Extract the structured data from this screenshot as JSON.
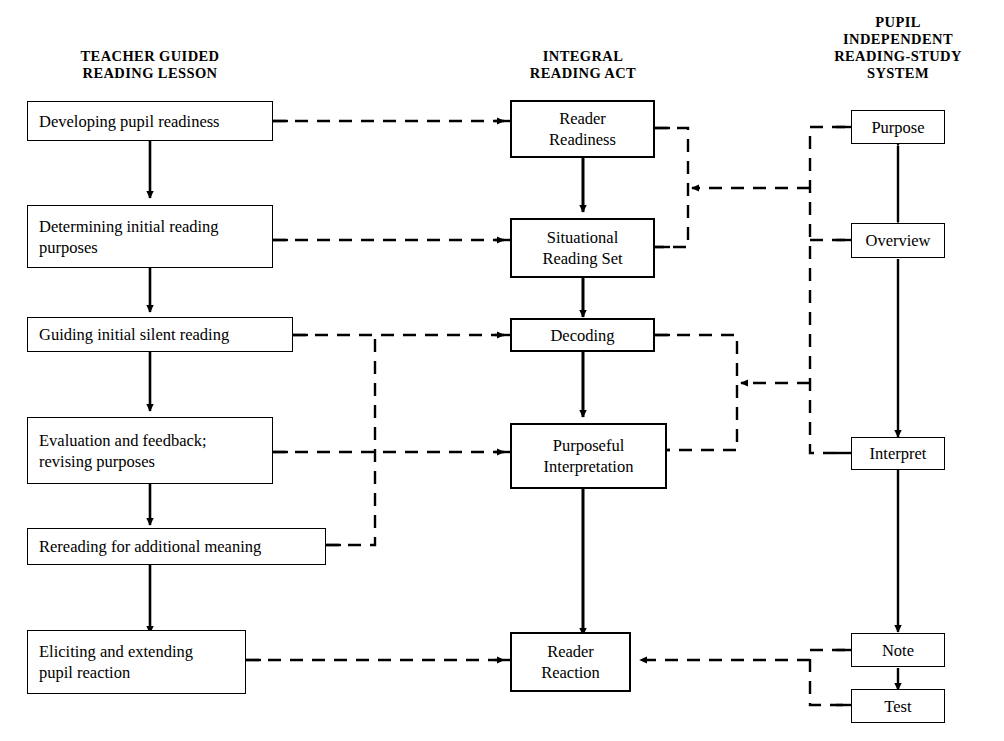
{
  "diagram": {
    "ink_color": "#000000",
    "background_color": "#ffffff"
  },
  "columns": [
    {
      "id": "teacher",
      "header": "TEACHER GUIDED\nREADING LESSON"
    },
    {
      "id": "integral",
      "header": "INTEGRAL\nREADING ACT"
    },
    {
      "id": "pupil",
      "header": "PUPIL\nINDEPENDENT\nREADING-STUDY\nSYSTEM"
    }
  ],
  "teacher_nodes": [
    {
      "id": "developing",
      "label": "Developing  pupil readiness"
    },
    {
      "id": "determining",
      "label": "Determining initial reading\npurposes"
    },
    {
      "id": "guiding",
      "label": "Guiding initial silent reading"
    },
    {
      "id": "evaluation",
      "label": "Evaluation and feedback;\nrevising purposes"
    },
    {
      "id": "rereading",
      "label": "Rereading for additional meaning"
    },
    {
      "id": "eliciting",
      "label": "Eliciting and extending\npupil reaction"
    }
  ],
  "integral_nodes": [
    {
      "id": "reader-readiness",
      "label": "Reader\nReadiness"
    },
    {
      "id": "situational",
      "label": "Situational\nReading Set"
    },
    {
      "id": "decoding",
      "label": "Decoding"
    },
    {
      "id": "purposeful",
      "label": "Purposeful\nInterpretation"
    },
    {
      "id": "reader-reaction",
      "label": "Reader\nReaction"
    }
  ],
  "pupil_nodes": [
    {
      "id": "purpose",
      "label": "Purpose"
    },
    {
      "id": "overview",
      "label": "Overview"
    },
    {
      "id": "interpret",
      "label": "Interpret"
    },
    {
      "id": "note",
      "label": "Note"
    },
    {
      "id": "test",
      "label": "Test"
    }
  ],
  "connections": {
    "teacher_sequence_solid": [
      "developing -> determining",
      "determining -> guiding",
      "guiding -> evaluation",
      "evaluation -> rereading",
      "rereading -> eliciting"
    ],
    "integral_sequence_solid": [
      "reader-readiness -> situational",
      "situational -> decoding",
      "decoding -> purposeful",
      "purposeful -> reader-reaction"
    ],
    "pupil_sequence_solid": [
      "purpose <-> overview",
      "overview -> interpret",
      "interpret -> note",
      "note -> test"
    ],
    "teacher_to_integral_dashed": [
      "developing -> reader-readiness",
      "determining -> situational",
      "guiding -> decoding",
      "evaluation -> purposeful",
      "rereading -> decoding-line",
      "eliciting -> reader-reaction"
    ],
    "pupil_to_integral_dashed": [
      "purpose+overview bracket -> situational",
      "interpret bracket -> purposeful-line",
      "note+test bracket -> reader-reaction"
    ]
  }
}
